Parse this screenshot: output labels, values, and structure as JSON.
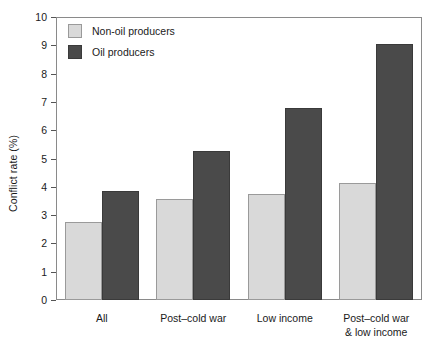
{
  "chart_data": {
    "type": "bar",
    "title": "",
    "xlabel": "",
    "ylabel": "Conflict rate (%)",
    "ylim": [
      0,
      10
    ],
    "ytick_step": 1,
    "yticks": [
      "10",
      "9",
      "8",
      "7",
      "6",
      "5",
      "4",
      "3",
      "2",
      "1",
      "0"
    ],
    "grid": false,
    "legend_position": "top-left-inside",
    "categories": [
      "All",
      "Post–cold war",
      "Low income",
      "Post–cold war\n& low income"
    ],
    "series": [
      {
        "name": "Non-oil producers",
        "color": "#d9d9d9",
        "values": [
          2.75,
          3.57,
          3.75,
          4.15
        ]
      },
      {
        "name": "Oil producers",
        "color": "#4a4a4a",
        "values": [
          3.85,
          5.27,
          6.8,
          9.05
        ]
      }
    ]
  },
  "legend": {
    "items": [
      {
        "label": "Non-oil producers",
        "swatch": "light"
      },
      {
        "label": "Oil producers",
        "swatch": "dark"
      }
    ]
  },
  "colors": {
    "non_oil": "#d9d9d9",
    "oil": "#4a4a4a",
    "axis": "#8a8a8a",
    "text": "#1a1a1a",
    "background": "#ffffff"
  }
}
